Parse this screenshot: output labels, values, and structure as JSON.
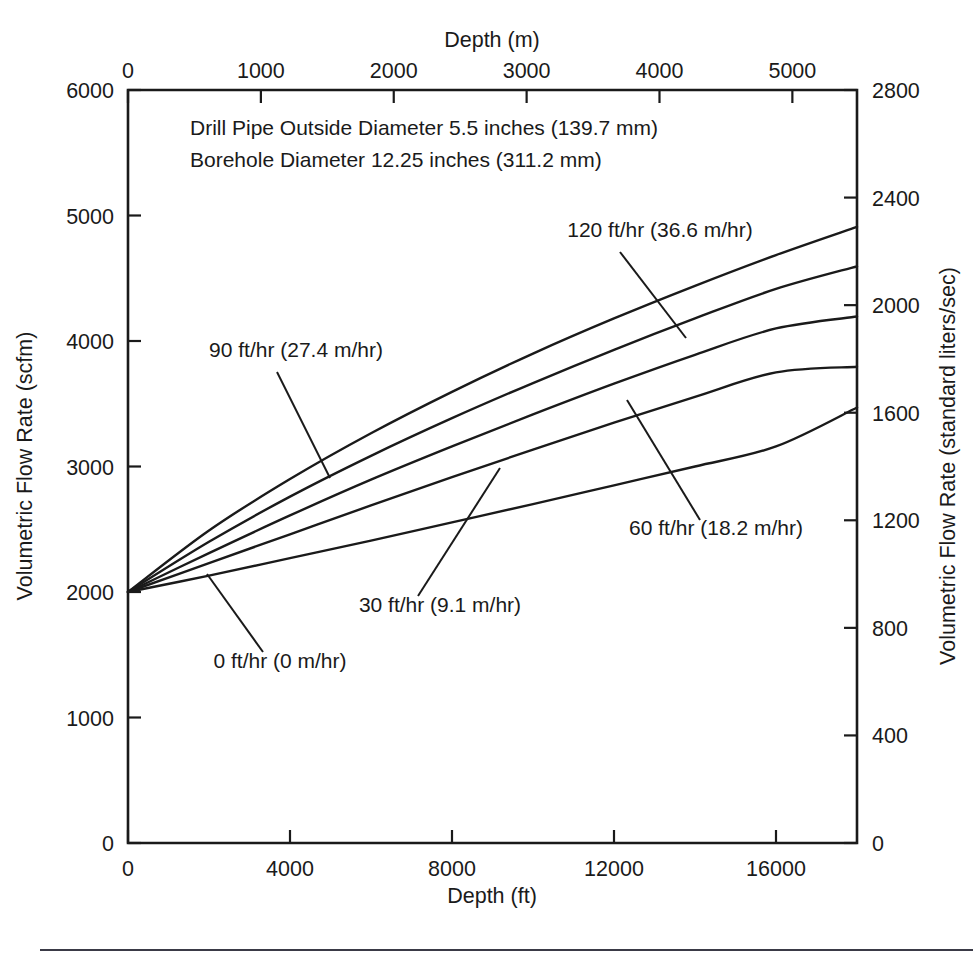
{
  "figure": {
    "notes": [
      "Drill Pipe Outside Diameter 5.5 inches (139.7 mm)",
      "Borehole Diameter 12.25 inches (311.2 mm)"
    ],
    "ink_color": "#1a1a1a",
    "background_color": "#ffffff"
  },
  "chart_data": {
    "type": "line",
    "title": "",
    "xlabel": "Depth (ft)",
    "ylabel": "Volumetric Flow Rate (scfm)",
    "x2label": "Depth (m)",
    "y2label": "Volumetric Flow Rate (standard liters/sec)",
    "grid": false,
    "legend": "inline-annotations",
    "xlim": [
      0,
      18000
    ],
    "ylim": [
      0,
      6000
    ],
    "x2lim": [
      0,
      5486.4
    ],
    "y2lim": [
      0,
      2800
    ],
    "xticks": [
      0,
      4000,
      8000,
      12000,
      16000
    ],
    "xticklabels": [
      "0",
      "4000",
      "8000",
      "12000",
      "16000"
    ],
    "yticks": [
      0,
      1000,
      2000,
      3000,
      4000,
      5000,
      6000
    ],
    "yticklabels": [
      "0",
      "1000",
      "2000",
      "3000",
      "4000",
      "5000",
      "6000"
    ],
    "x2ticks": [
      0,
      1000,
      2000,
      3000,
      4000,
      5000
    ],
    "x2ticklabels": [
      "0",
      "1000",
      "2000",
      "3000",
      "4000",
      "5000"
    ],
    "y2ticks": [
      0,
      400,
      800,
      1200,
      1600,
      2000,
      2400,
      2800
    ],
    "y2ticklabels": [
      "0",
      "400",
      "800",
      "1200",
      "1600",
      "2000",
      "2400",
      "2800"
    ],
    "x": [
      0,
      2000,
      4000,
      6000,
      8000,
      10000,
      12000,
      14000,
      16000,
      18000
    ],
    "series": [
      {
        "name": "120 ft/hr (36.6 m/hr)",
        "label": "120 ft/hr (36.6 m/hr)",
        "values": [
          2000,
          2490,
          2900,
          3265,
          3595,
          3900,
          4180,
          4440,
          4685,
          4910
        ],
        "label_x": 660,
        "label_y": 237,
        "leader": [
          [
            620,
            252
          ],
          [
            686,
            338
          ]
        ],
        "anchor": "middle"
      },
      {
        "name": "90 ft/hr (27.4 m/hr)",
        "label": "90 ft/hr (27.4 m/hr)",
        "values": [
          2000,
          2400,
          2760,
          3085,
          3385,
          3665,
          3930,
          4180,
          4415,
          4595
        ],
        "label_x": 296,
        "label_y": 357,
        "leader": [
          [
            277,
            372
          ],
          [
            330,
            478
          ]
        ],
        "anchor": "middle"
      },
      {
        "name": "60 ft/hr (18.2 m/hr)",
        "label": "60 ft/hr (18.2 m/hr)",
        "values": [
          2000,
          2310,
          2610,
          2895,
          3160,
          3415,
          3660,
          3890,
          4100,
          4195
        ],
        "label_x": 716,
        "label_y": 535,
        "leader": [
          [
            700,
            520
          ],
          [
            627,
            400
          ]
        ],
        "anchor": "middle"
      },
      {
        "name": "30 ft/hr (9.1 m/hr)",
        "label": "30 ft/hr (9.1 m/hr)",
        "values": [
          2000,
          2230,
          2460,
          2690,
          2915,
          3135,
          3350,
          3555,
          3750,
          3795
        ],
        "label_x": 440,
        "label_y": 612,
        "leader": [
          [
            418,
            596
          ],
          [
            500,
            468
          ]
        ],
        "anchor": "middle"
      },
      {
        "name": "0 ft/hr (0 m/hr)",
        "label": "0 ft/hr (0 m/hr)",
        "values": [
          2000,
          2130,
          2270,
          2410,
          2555,
          2700,
          2850,
          3000,
          3160,
          3470
        ],
        "label_x": 280,
        "label_y": 668,
        "leader": [
          [
            263,
            652
          ],
          [
            207,
            574
          ]
        ],
        "anchor": "middle"
      }
    ]
  }
}
